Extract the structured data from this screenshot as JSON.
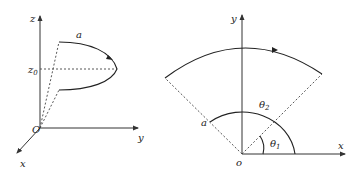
{
  "left_diagram": {
    "axes": {
      "z": "z",
      "y": "y",
      "x": "x",
      "origin": "O"
    },
    "z0_label": "z",
    "z0_sub": "0",
    "curve_label": "a"
  },
  "right_diagram": {
    "axes": {
      "y": "y",
      "x": "x",
      "origin": "o"
    },
    "radius_label": "a",
    "theta2": "θ",
    "theta2_sub": "2",
    "theta1": "θ",
    "theta1_sub": "1"
  },
  "colors": {
    "line": "#222222",
    "background": "#ffffff"
  }
}
